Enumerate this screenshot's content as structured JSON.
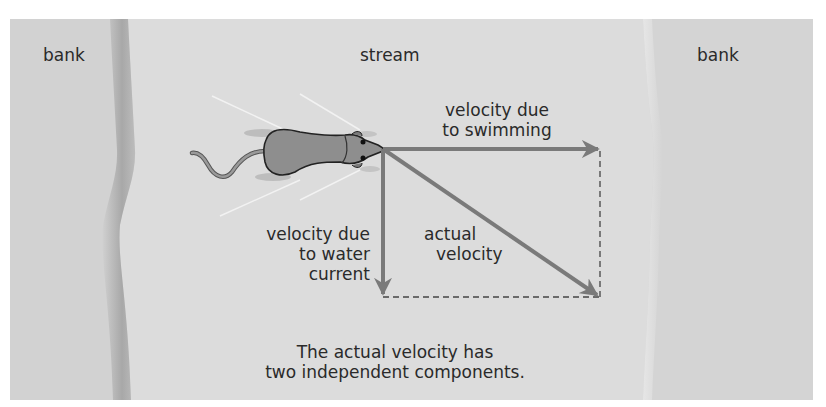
{
  "labels": {
    "bank_left": "bank",
    "stream": "stream",
    "bank_right": "bank",
    "swimming": [
      "velocity due",
      "to swimming"
    ],
    "current": [
      "velocity due",
      "to water",
      "current"
    ],
    "actual": [
      "actual",
      "velocity"
    ],
    "caption": [
      "The actual velocity has",
      "two independent components."
    ]
  },
  "colors": {
    "bank": "#d2d2d2",
    "bank_shadow": "#a9a9a9",
    "stream": "#dcdcdc",
    "arrow": "#7a7a7a",
    "mouse": "#8e8e8e",
    "text": "#2a2a2a"
  },
  "vectors": {
    "origin": [
      383,
      149
    ],
    "swimming_end": [
      600,
      149
    ],
    "current_end": [
      383,
      297
    ],
    "actual_end": [
      600,
      297
    ]
  }
}
